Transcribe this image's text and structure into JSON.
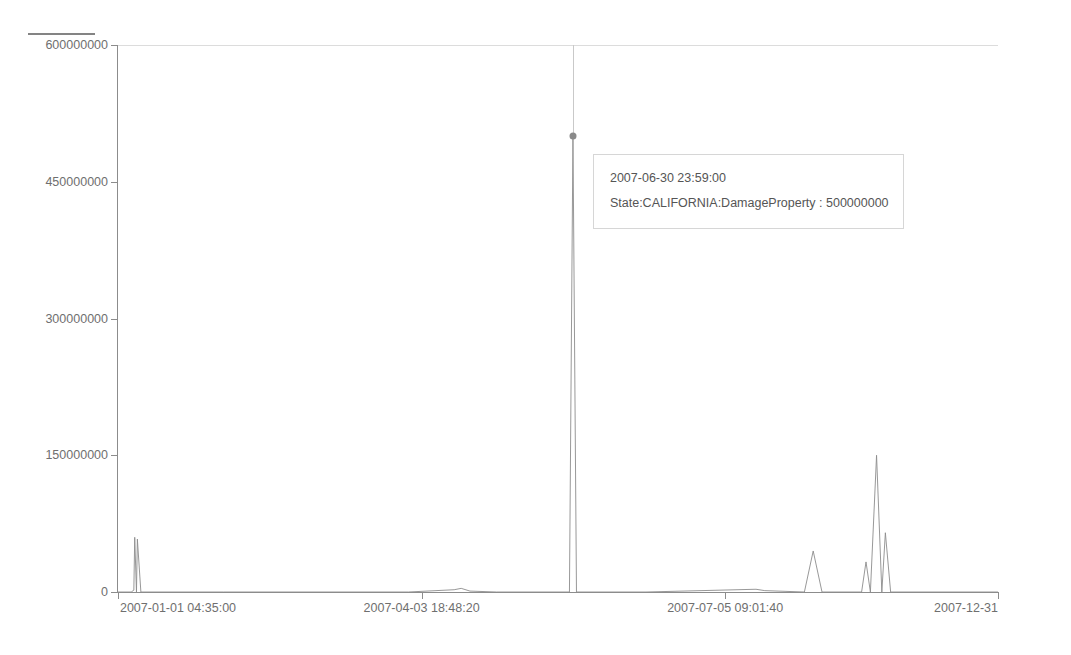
{
  "chart_title": "",
  "colors": {
    "series_line": "#8c8c8c",
    "axis": "#8c8c8c",
    "tick_label": "#6f6f6f",
    "grid": "#dcdcdc",
    "tooltip_border": "#d6d6d6",
    "tooltip_bg": "#ffffff",
    "crosshair": "#c9c9c9",
    "hover_dot": "#8a8a8a",
    "background": "#ffffff"
  },
  "legend": {
    "marker_name": "series-line-swatch"
  },
  "tooltip": {
    "timestamp": "2007-06-30 23:59:00",
    "measure": "State:CALIFORNIA:DamageProperty : 500000000"
  },
  "hover_point": {
    "x_label": "2007-06-30 23:59:00",
    "value": 500000000
  },
  "chart_data": {
    "type": "line",
    "title": "",
    "xlabel": "",
    "ylabel": "",
    "ylim": [
      0,
      600000000
    ],
    "yticks": [
      0,
      150000000,
      300000000,
      450000000,
      600000000
    ],
    "ytick_labels": [
      "0",
      "150000000",
      "300000000",
      "450000000",
      "600000000"
    ],
    "xtick_labels": [
      "2007-01-01 04:35:00",
      "2007-04-03 18:48:20",
      "2007-07-05 09:01:40",
      "2007-12-31"
    ],
    "xtick_positions_frac": [
      0.0,
      0.345,
      0.69,
      1.0
    ],
    "grid": false,
    "legend_position": "top-left",
    "series": [
      {
        "name": "State:CALIFORNIA:DamageProperty",
        "x_domain": [
          "2007-01-01",
          "2007-12-31"
        ],
        "points": [
          {
            "x_frac": 0.0,
            "value": 0
          },
          {
            "x_frac": 0.015,
            "value": 0
          },
          {
            "x_frac": 0.018,
            "value": 2000000
          },
          {
            "x_frac": 0.021,
            "value": 0
          },
          {
            "x_frac": 0.019,
            "value": 60000000
          },
          {
            "x_frac": 0.022,
            "value": 58000000
          },
          {
            "x_frac": 0.026,
            "value": 0
          },
          {
            "x_frac": 0.12,
            "value": 0
          },
          {
            "x_frac": 0.33,
            "value": 0
          },
          {
            "x_frac": 0.382,
            "value": 2500000
          },
          {
            "x_frac": 0.39,
            "value": 4000000
          },
          {
            "x_frac": 0.4,
            "value": 1000000
          },
          {
            "x_frac": 0.43,
            "value": 0
          },
          {
            "x_frac": 0.513,
            "value": 0
          },
          {
            "x_frac": 0.517,
            "value": 500000000
          },
          {
            "x_frac": 0.521,
            "value": 0
          },
          {
            "x_frac": 0.6,
            "value": 0
          },
          {
            "x_frac": 0.725,
            "value": 3000000
          },
          {
            "x_frac": 0.735,
            "value": 1500000
          },
          {
            "x_frac": 0.78,
            "value": 0
          },
          {
            "x_frac": 0.79,
            "value": 45000000
          },
          {
            "x_frac": 0.8,
            "value": 0
          },
          {
            "x_frac": 0.845,
            "value": 0
          },
          {
            "x_frac": 0.85,
            "value": 33000000
          },
          {
            "x_frac": 0.855,
            "value": 0
          },
          {
            "x_frac": 0.862,
            "value": 150000000
          },
          {
            "x_frac": 0.868,
            "value": 0
          },
          {
            "x_frac": 0.872,
            "value": 65000000
          },
          {
            "x_frac": 0.878,
            "value": 0
          },
          {
            "x_frac": 1.0,
            "value": 0
          }
        ]
      }
    ],
    "annotations": [
      {
        "type": "tooltip",
        "text": "2007-06-30 23:59:00 / State:CALIFORNIA:DamageProperty : 500000000",
        "at_value": 500000000
      }
    ]
  }
}
